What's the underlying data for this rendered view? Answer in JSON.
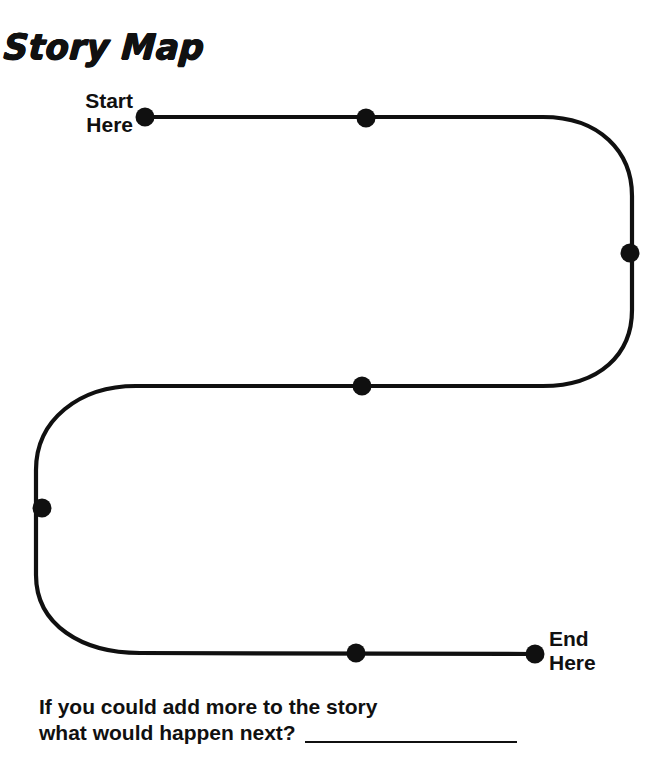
{
  "worksheet": {
    "title": "Story Map",
    "start_label": {
      "line1": "Start",
      "line2": "Here"
    },
    "end_label": {
      "line1": "End",
      "line2": "Here"
    },
    "prompt": {
      "line1": "If you could add more to the story",
      "line2": "what would happen next?",
      "answer_value": ""
    }
  },
  "path": {
    "stroke_color": "#101010",
    "stroke_width": 4.2,
    "dot_color": "#101010",
    "dot_radius": 9.5,
    "d": "M 145 117 L 543 117 C 600 117 632 152 632 196 L 632 310 C 632 354 600 386 543 386 L 136 386 C 79 386 36 420 36 470 L 36 575 C 36 625 82 653 140 653 L 535 654",
    "nodes": [
      {
        "name": "start",
        "x": 145,
        "y": 117
      },
      {
        "name": "node-2",
        "x": 366,
        "y": 118
      },
      {
        "name": "node-3",
        "x": 630,
        "y": 253
      },
      {
        "name": "node-4",
        "x": 362,
        "y": 386
      },
      {
        "name": "node-5",
        "x": 42,
        "y": 508
      },
      {
        "name": "node-6",
        "x": 356,
        "y": 653
      },
      {
        "name": "end",
        "x": 535,
        "y": 654
      }
    ]
  }
}
